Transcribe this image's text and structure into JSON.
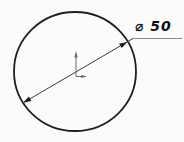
{
  "drawing": {
    "dimension_label": "⌀ 50",
    "diameter_value": 50,
    "colors": {
      "background": "#fbfbf9",
      "outline": "#1f1f1f",
      "dimension_line": "#3c3c3c",
      "arrowhead": "#1a1a1a",
      "leader": "#8e8e8e",
      "axis_marker": "#6b6b6b",
      "label_text": "#0d0d0d"
    }
  }
}
